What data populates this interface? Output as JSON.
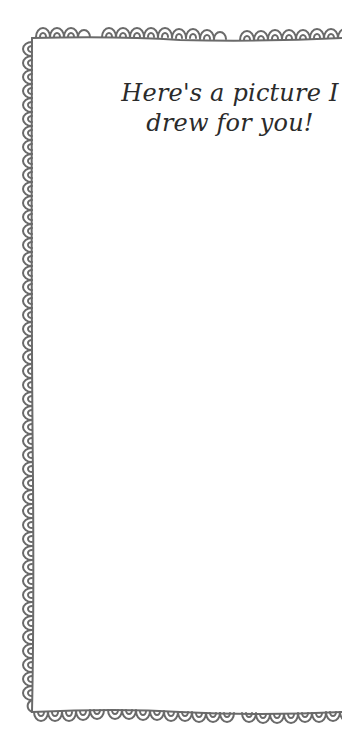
{
  "page": {
    "type": "printable-note-card",
    "title_lines": [
      "Here's a picture I",
      "drew for you!"
    ]
  },
  "frame": {
    "style": "hand-drawn scalloped doodle border",
    "stroke_color": "#6a6a6a",
    "background_color": "#ffffff"
  },
  "colors": {
    "text": "#2b2b2b",
    "border": "#6a6a6a"
  }
}
